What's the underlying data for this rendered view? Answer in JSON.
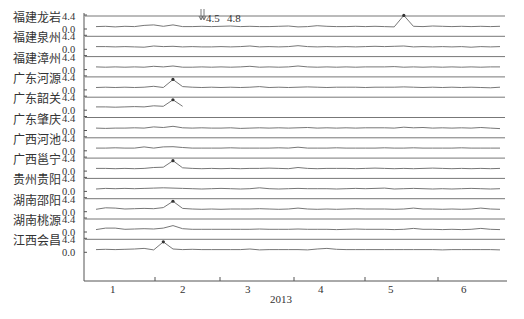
{
  "chart_data": {
    "type": "line",
    "title": "",
    "xlabel": "2013",
    "ylabel": "",
    "layout": "stacked small-multiples, one horizontal panel per station, shared x axis",
    "x_ticks": [
      "1",
      "2",
      "3",
      "4",
      "5",
      "6"
    ],
    "y_ticks_per_panel": [
      "4.4",
      "0.0"
    ],
    "ylim": [
      0.0,
      4.4
    ],
    "grid": false,
    "legend": null,
    "annotation": {
      "text": "4.5  4.8",
      "arrows": 2,
      "position": "top, near month 2.5"
    },
    "series": [
      {
        "name": "福建龙岩",
        "peak_markers": [
          {
            "month": 5.3,
            "label": "peak"
          }
        ],
        "values": [
          0.5,
          0.6,
          0.4,
          0.6,
          0.5,
          0.9,
          1.1,
          0.6,
          1.1,
          0.5,
          0.5,
          0.6,
          0.5,
          0.6,
          0.7,
          0.5,
          0.6,
          0.5,
          0.5,
          0.6,
          0.7,
          0.4,
          0.5,
          0.8,
          0.6,
          0.5,
          0.5,
          0.6,
          0.5,
          0.6,
          0.5,
          0.4,
          4.4,
          0.6,
          0.5,
          0.7,
          0.6,
          0.5,
          0.6,
          0.5,
          0.6,
          0.5,
          0.6
        ]
      },
      {
        "name": "福建泉州",
        "peak_markers": [],
        "values": [
          0.6,
          0.6,
          0.5,
          0.6,
          0.5,
          0.4,
          0.8,
          0.6,
          0.7,
          0.5,
          0.6,
          0.5,
          0.5,
          0.6,
          0.5,
          0.6,
          0.8,
          0.5,
          0.6,
          0.5,
          0.6,
          0.9,
          0.6,
          0.5,
          0.6,
          0.5,
          0.6,
          0.5,
          0.6,
          0.7,
          0.6,
          0.7,
          0.8,
          0.5,
          0.6,
          0.5,
          0.6,
          0.5,
          0.6,
          0.4,
          0.6,
          0.5,
          0.6
        ]
      },
      {
        "name": "福建漳州",
        "peak_markers": [],
        "values": [
          0.6,
          0.5,
          0.6,
          0.5,
          0.6,
          0.5,
          0.8,
          0.6,
          0.9,
          0.5,
          0.5,
          0.6,
          0.5,
          0.6,
          0.5,
          0.6,
          0.8,
          0.5,
          0.6,
          0.5,
          0.6,
          0.9,
          0.6,
          0.5,
          0.6,
          0.5,
          0.6,
          0.5,
          0.6,
          0.6,
          0.6,
          0.7,
          0.5,
          0.6,
          0.5,
          0.6,
          0.5,
          0.6,
          0.5,
          0.6,
          0.5,
          0.6,
          0.6
        ]
      },
      {
        "name": "广东河源",
        "peak_markers": [
          {
            "month": 1.9
          }
        ],
        "values": [
          0.5,
          0.6,
          0.5,
          0.6,
          0.5,
          0.6,
          0.9,
          0.5,
          3.3,
          0.8,
          0.6,
          0.5,
          0.6,
          0.5,
          0.6,
          0.5,
          0.6,
          0.8,
          0.5,
          0.6,
          0.5,
          0.6,
          0.7,
          0.6,
          0.5,
          0.6,
          0.6,
          0.6,
          0.5,
          0.6,
          0.6,
          0.6,
          0.7,
          0.6,
          0.5,
          0.6,
          0.5,
          0.6,
          0.5,
          0.6,
          0.5,
          0.4,
          0.6
        ]
      },
      {
        "name": "广东韶关",
        "peak_markers": [
          {
            "month": 1.9
          }
        ],
        "values": [
          0.8,
          0.8,
          0.7,
          0.8,
          0.9,
          0.8,
          1.2,
          1.0,
          3.3,
          1.0
        ]
      },
      {
        "name": "广东肇庆",
        "peak_markers": [],
        "values": [
          0.5,
          0.4,
          0.5,
          0.5,
          0.6,
          0.5,
          0.9,
          0.7,
          1.1,
          0.6,
          0.5,
          0.6,
          0.5,
          0.5,
          0.6,
          0.4,
          0.5,
          0.6,
          0.5,
          0.6,
          0.5,
          0.6,
          0.7,
          0.5,
          0.6,
          0.5,
          0.6,
          0.5,
          0.6,
          0.6,
          0.6,
          0.5,
          0.8,
          0.6,
          0.7,
          0.5,
          0.6,
          0.5,
          0.6,
          0.5,
          0.7,
          0.5,
          0.3
        ]
      },
      {
        "name": "广西河池",
        "peak_markers": [],
        "values": [
          0.6,
          0.6,
          0.7,
          0.6,
          0.6,
          1.0,
          0.6,
          1.0,
          1.1,
          0.8,
          0.6,
          0.6,
          0.6,
          0.6,
          0.7,
          0.6,
          0.6,
          0.6,
          0.6,
          0.7,
          0.6,
          0.9,
          0.6,
          0.6,
          0.6,
          0.7,
          0.6,
          0.6,
          0.6,
          0.6,
          0.7,
          0.6,
          0.6,
          0.7,
          0.6,
          0.6,
          0.6,
          0.6,
          0.7,
          0.6,
          0.6,
          0.6,
          0.6
        ]
      },
      {
        "name": "广西邕宁",
        "peak_markers": [
          {
            "month": 1.9
          }
        ],
        "values": [
          0.6,
          0.6,
          0.5,
          0.6,
          0.5,
          0.6,
          0.9,
          1.0,
          3.3,
          0.8,
          0.6,
          0.5,
          0.6,
          0.5,
          0.6,
          0.5,
          0.6,
          0.6,
          0.7,
          0.6,
          0.5,
          0.9,
          0.6,
          0.5,
          0.6,
          0.6,
          0.6,
          0.5,
          0.6,
          0.7,
          0.6,
          0.5,
          0.6,
          0.5,
          0.6,
          0.7,
          0.6,
          0.5,
          0.6,
          0.5,
          0.6,
          0.5,
          0.6
        ]
      },
      {
        "name": "贵州贵阳",
        "peak_markers": [],
        "values": [
          0.5,
          0.7,
          0.6,
          0.7,
          0.6,
          0.7,
          0.8,
          0.9,
          0.8,
          0.7,
          0.6,
          0.5,
          0.6,
          0.7,
          0.6,
          0.5,
          0.6,
          0.9,
          0.6,
          0.5,
          0.6,
          0.7,
          0.6,
          0.6,
          0.6,
          0.5,
          0.6,
          0.7,
          0.6,
          0.7,
          0.8,
          0.5,
          0.6,
          0.7,
          0.6,
          0.5,
          0.6,
          0.5,
          0.6,
          0.7,
          0.6,
          0.5,
          0.6
        ]
      },
      {
        "name": "湖南邵阳",
        "peak_markers": [
          {
            "month": 1.9
          }
        ],
        "values": [
          0.5,
          1.0,
          0.9,
          0.6,
          0.7,
          0.8,
          0.7,
          1.1,
          3.3,
          0.8,
          0.6,
          0.5,
          0.6,
          0.5,
          0.6,
          0.6,
          0.6,
          0.7,
          0.6,
          0.5,
          0.6,
          0.9,
          0.6,
          0.5,
          0.6,
          0.5,
          0.6,
          0.7,
          0.6,
          0.6,
          0.6,
          0.5,
          0.6,
          0.9,
          0.6,
          0.6,
          0.5,
          0.6,
          0.5,
          0.6,
          0.9,
          0.6,
          0.5
        ]
      },
      {
        "name": "湖南桃源",
        "peak_markers": [],
        "values": [
          0.5,
          1.0,
          1.0,
          0.6,
          0.7,
          0.8,
          0.7,
          1.0,
          1.9,
          0.8,
          0.6,
          0.6,
          0.6,
          0.6,
          0.6,
          0.6,
          0.6,
          0.7,
          0.6,
          0.6,
          0.6,
          0.7,
          0.6,
          0.6,
          0.6,
          0.5,
          0.6,
          0.7,
          0.6,
          0.6,
          0.6,
          0.5,
          0.6,
          0.9,
          0.6,
          0.6,
          0.5,
          0.6,
          0.5,
          0.6,
          0.9,
          0.6,
          0.5
        ]
      },
      {
        "name": "江西会昌",
        "peak_markers": [
          {
            "month": 1.9
          }
        ],
        "values": [
          0.6,
          0.7,
          0.6,
          0.7,
          0.8,
          1.0,
          0.5,
          3.3,
          0.8,
          0.6,
          0.7,
          0.6,
          0.6,
          0.6,
          0.6,
          0.6,
          0.8,
          0.5,
          0.6,
          0.6,
          0.6,
          0.6,
          0.5,
          0.8,
          1.0,
          0.7,
          0.6,
          0.6,
          0.6,
          0.6,
          0.6,
          0.6,
          0.6,
          0.6,
          0.6,
          0.6,
          0.5,
          0.6,
          0.6,
          0.6,
          0.6,
          0.6,
          0.5
        ]
      }
    ]
  },
  "axis": {
    "y_top_label": "4.4",
    "y_bottom_label": "0.0",
    "x_label": "2013",
    "x_ticks": [
      "1",
      "2",
      "3",
      "4",
      "5",
      "6"
    ]
  },
  "annotation": {
    "text1": "4.5",
    "text2": "4.8"
  },
  "colors": {
    "line": "#777777",
    "axis": "#555555",
    "text": "#333333",
    "marker": "#333333"
  }
}
